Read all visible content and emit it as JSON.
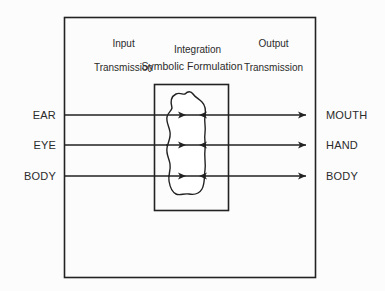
{
  "figure": {
    "title_visible": false,
    "background_color": "#fcfcfc",
    "stroke_color": "#222222",
    "text_color": "#2b2b2b"
  },
  "column_headings": [
    {
      "id": "input",
      "line1": "Input",
      "line2": "Transmission",
      "cx": 118,
      "y": 26
    },
    {
      "id": "integration",
      "line1": "Integration",
      "line2": "",
      "cx": 192,
      "y": 32
    },
    {
      "id": "output",
      "line1": "Output",
      "line2": "Transmission",
      "cx": 268,
      "y": 26
    }
  ],
  "sub_heading": {
    "label": "Symbolic Formulation",
    "cx": 192,
    "y": 61
  },
  "input_labels": [
    {
      "label": "EAR",
      "y": 115
    },
    {
      "label": "EYE",
      "y": 145
    },
    {
      "label": "BODY",
      "y": 176
    }
  ],
  "output_labels": [
    {
      "label": "MOUTH",
      "y": 115
    },
    {
      "label": "HAND",
      "y": 145
    },
    {
      "label": "BODY",
      "y": 176
    }
  ],
  "outer_frame": {
    "x": 64,
    "y": 17,
    "width": 251,
    "height": 260
  },
  "inner_box": {
    "x": 154,
    "y": 84,
    "width": 74,
    "height": 126
  },
  "blob": {
    "name": "symbolic-formulation-blob",
    "path": "M 172 108 C 170 101 172 96 176 94 C 180 92 183 95 185 94 C 188 91 191 91 193 94 C 195 97 199 99 202 102 C 205 105 206 110 205 116 C 204 122 206 127 205 133 C 204 139 206 144 205 150 C 204 157 206 163 205 170 C 204 177 205 184 202 189 C 199 194 194 195 189 194 C 184 193 180 196 176 194 C 172 192 170 187 169 181 C 168 175 171 170 170 164 C 169 158 166 154 167 148 C 168 142 171 138 170 132 C 169 126 166 122 167 117 C 168 112 171 112 172 108 Z"
  },
  "flow_lines": [
    {
      "id": "ear-to-mouth",
      "y": 115,
      "x_start": 64,
      "x_end": 306
    },
    {
      "id": "eye-to-hand",
      "y": 145,
      "x_start": 64,
      "x_end": 306
    },
    {
      "id": "body-to-body",
      "y": 176,
      "x_start": 64,
      "x_end": 306
    }
  ],
  "arrowheads": [
    {
      "id": "inner-left-row1",
      "x": 186,
      "y": 115,
      "dir": "right"
    },
    {
      "id": "inner-right-row1",
      "x": 199,
      "y": 115,
      "dir": "left"
    },
    {
      "id": "inner-left-row2",
      "x": 186,
      "y": 145,
      "dir": "right"
    },
    {
      "id": "inner-right-row2",
      "x": 199,
      "y": 145,
      "dir": "left"
    },
    {
      "id": "inner-left-row3",
      "x": 186,
      "y": 176,
      "dir": "right"
    },
    {
      "id": "inner-right-row3",
      "x": 199,
      "y": 176,
      "dir": "left"
    },
    {
      "id": "output-row1",
      "x": 306,
      "y": 115,
      "dir": "right"
    },
    {
      "id": "output-row2",
      "x": 306,
      "y": 145,
      "dir": "right"
    },
    {
      "id": "output-row3",
      "x": 306,
      "y": 176,
      "dir": "right"
    }
  ]
}
